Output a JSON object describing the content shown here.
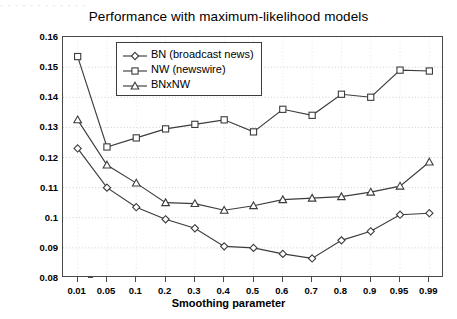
{
  "scan_artifact_text": "- - -     - - - - - - - - -",
  "chart_data": {
    "type": "line",
    "title": "Performance with maximum-likelihood models",
    "xlabel": "Smoothing parameter",
    "ylabel": "Min. Detection Cost",
    "categories": [
      "0.01",
      "0.05",
      "0.1",
      "0.2",
      "0.3",
      "0.4",
      "0.5",
      "0.6",
      "0.7",
      "0.8",
      "0.9",
      "0.95",
      "0.99"
    ],
    "yticks": [
      "0.08",
      "0.09",
      "0.1",
      "0.11",
      "0.12",
      "0.13",
      "0.14",
      "0.15",
      "0.16"
    ],
    "ylim": [
      0.08,
      0.16
    ],
    "grid": true,
    "legend_position": "top-left-inside",
    "series": [
      {
        "name": "BN (broadcast news)",
        "marker": "diamond",
        "color": "#3c3c3c",
        "values": [
          0.123,
          0.11,
          0.1035,
          0.0995,
          0.0965,
          0.0905,
          0.09,
          0.088,
          0.0865,
          0.0925,
          0.0955,
          0.101,
          0.1015
        ]
      },
      {
        "name": "NW (newswire)",
        "marker": "square",
        "color": "#3c3c3c",
        "values": [
          0.1535,
          0.1235,
          0.1265,
          0.1295,
          0.131,
          0.1325,
          0.1285,
          0.136,
          0.134,
          0.141,
          0.14,
          0.149,
          0.1487
        ]
      },
      {
        "name": "BNxNW",
        "marker": "triangle",
        "color": "#3c3c3c",
        "values": [
          0.1325,
          0.1175,
          0.1115,
          0.105,
          0.1047,
          0.1025,
          0.104,
          0.106,
          0.1065,
          0.107,
          0.1085,
          0.1105,
          0.1185
        ]
      }
    ]
  }
}
